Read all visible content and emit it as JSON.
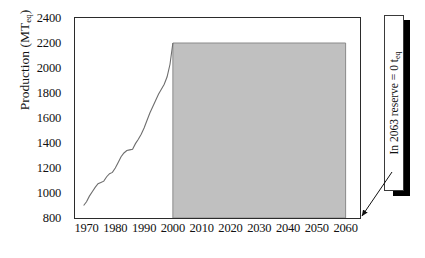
{
  "chart_data": {
    "type": "area",
    "title": "",
    "xlabel": "",
    "ylabel": "Production (MT",
    "ylabel_sub": "eq",
    "ylabel_close": ")",
    "xlim": [
      1966,
      2065
    ],
    "ylim": [
      800,
      2400
    ],
    "ytick_step": 200,
    "yticks": [
      800,
      1000,
      1200,
      1400,
      1600,
      1800,
      2000,
      2200,
      2400
    ],
    "ytick_labels": [
      "800",
      "1000",
      "1200",
      "1400",
      "1600",
      "1800",
      "2000",
      "2200",
      "2400"
    ],
    "xticks": [
      1970,
      1980,
      1990,
      2000,
      2010,
      2020,
      2030,
      2040,
      2050,
      2060
    ],
    "xtick_labels": [
      "1970",
      "1980",
      "1990",
      "2000",
      "2010",
      "2020",
      "2030",
      "2040",
      "2050",
      "2060"
    ],
    "grid": false,
    "legend": null,
    "plateau_level": 2200,
    "plateau_start": 2000,
    "plateau_end": 2060,
    "fill_color": "#c0c0c0",
    "line_color": "#6e6e6e",
    "axis_color": "#2b2b2b",
    "series": [
      {
        "name": "Historical production",
        "type": "line",
        "x": [
          1969,
          1970,
          1971,
          1972,
          1973,
          1974,
          1975,
          1976,
          1977,
          1978,
          1979,
          1980,
          1981,
          1982,
          1983,
          1984,
          1985,
          1986,
          1987,
          1988,
          1989,
          1990,
          1991,
          1992,
          1993,
          1994,
          1995,
          1996,
          1997,
          1998,
          1999,
          2000
        ],
        "values": [
          900,
          930,
          975,
          1010,
          1045,
          1075,
          1085,
          1095,
          1130,
          1155,
          1165,
          1200,
          1245,
          1290,
          1320,
          1340,
          1345,
          1350,
          1395,
          1430,
          1470,
          1520,
          1580,
          1640,
          1690,
          1740,
          1790,
          1830,
          1870,
          1930,
          2030,
          2200
        ]
      },
      {
        "name": "Projected plateau",
        "type": "area",
        "x": [
          2000,
          2060
        ],
        "values": [
          2200,
          2200
        ]
      }
    ],
    "annotations": [
      {
        "name": "reserve-depletion-note",
        "text_prefix": "In 2063 reserve = 0 t",
        "text_sub": "eq",
        "points_to_year": 2060,
        "points_to_value": 800
      }
    ]
  }
}
